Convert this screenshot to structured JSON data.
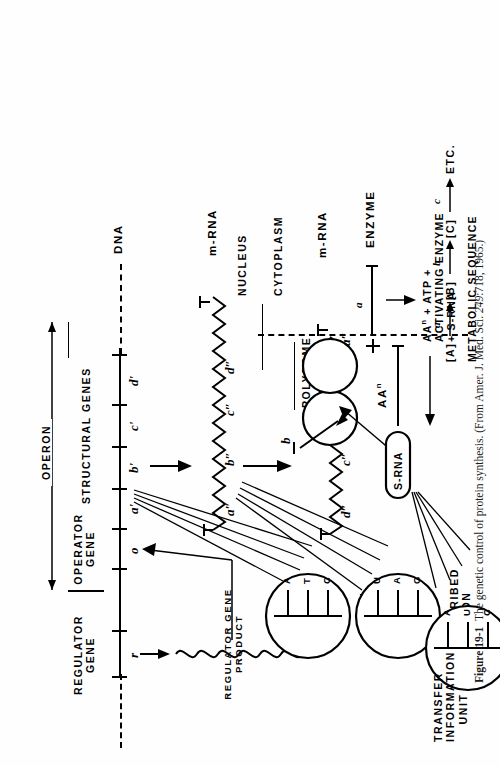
{
  "figure": {
    "number": "Figure 19-1",
    "caption_text": "The genetic control of protein synthesis. (From Amer. J. Med. Sci. ",
    "caption_volume": "249",
    "caption_tail": ":718, 1965.)",
    "title": "The genetic control of protein synthesis"
  },
  "dna": {
    "label": "DNA",
    "regulator_region_label_line1": "REGULATOR",
    "regulator_region_label_line2": "GENE",
    "regulator_gene_symbol": "r",
    "regulator_product_line1": "REGULATOR GENE",
    "regulator_product_line2": "PRODUCT",
    "operon_label": "OPERON",
    "operator_label_line1": "OPERATOR",
    "operator_label_line2": "GENE",
    "operator_symbol": "o",
    "structural_genes_label": "STRUCTURAL GENES",
    "structural_gene_symbols": [
      "a'",
      "b'",
      "c'",
      "d'"
    ]
  },
  "mrna": {
    "label": "m-RNA",
    "segment_symbols": [
      "a″",
      "b″",
      "c″",
      "d″"
    ]
  },
  "polysome": {
    "label": "POLYSOME",
    "mrna_label": "m-RNA",
    "segment_symbols": [
      "c″",
      "d″",
      "a″"
    ],
    "ribosome_count": 2,
    "nascent_chain_symbol": "b"
  },
  "cell": {
    "nucleus_label": "NUCLEUS",
    "cytoplasm_label": "CYTOPLASM"
  },
  "codon_circles": [
    {
      "name": "codon",
      "title_line1": "CODON",
      "title_line2": "",
      "bases": [
        "A",
        "T",
        "C"
      ]
    },
    {
      "name": "transcribed-codon",
      "title_line1": "TRANSCRIBED",
      "title_line2": "CODON",
      "bases": [
        "U",
        "A",
        "G"
      ]
    },
    {
      "name": "transfer-information-unit",
      "title_line1": "TRANSFER",
      "title_line2": "INFORMATION",
      "title_line3": "UNIT",
      "bases": [
        "A",
        "U",
        "C"
      ]
    }
  ],
  "srna": {
    "label": "S-RNA",
    "amino_acid_label": "AA",
    "amino_acid_superscript": "n",
    "activation_line1": "AA",
    "activation_line1_sup": "n",
    "activation_line1_rest": " + ATP +",
    "activation_line2": "ACTIVATING ENZYME",
    "activation_line3": "+ S-RNA"
  },
  "enzyme": {
    "label": "ENZYME",
    "symbol": "a",
    "plus_sign": "+"
  },
  "metabolic": {
    "label": "METABOLIC SEQUENCE",
    "substrates": [
      "[A]",
      "[B]",
      "[C]"
    ],
    "catalysts": [
      "a",
      "b",
      "c"
    ],
    "terminator": "ETC."
  },
  "colors": {
    "ink": "#000000",
    "paper": "#ffffff"
  }
}
